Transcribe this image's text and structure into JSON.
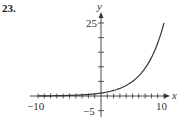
{
  "problem": {
    "number": "23."
  },
  "chart_data": {
    "type": "line",
    "title": "",
    "xlabel": "x",
    "ylabel": "y",
    "xlim": [
      -10,
      10
    ],
    "ylim": [
      -5,
      27
    ],
    "x_tick_labels": [
      "-10",
      "10"
    ],
    "y_tick_labels": [
      "25",
      "-5"
    ],
    "x_ticks_minor_step": 1,
    "y_ticks_minor_step": 5,
    "grid": false,
    "series": [
      {
        "name": "curve",
        "description": "exponential growth curve, approx y = 1.38^x",
        "x": [
          -10,
          -8,
          -6,
          -4,
          -2,
          0,
          2,
          4,
          6,
          8,
          10
        ],
        "values": [
          0.04,
          0.08,
          0.14,
          0.28,
          0.53,
          1.0,
          1.9,
          3.6,
          6.9,
          13.1,
          25.0
        ]
      }
    ],
    "colors": {
      "axis": "#333333",
      "curve": "#333333"
    }
  },
  "labels": {
    "x_axis": "x",
    "y_axis": "y",
    "x_min": "−10",
    "x_max": "10",
    "y_max": "25",
    "y_min": "−5"
  }
}
